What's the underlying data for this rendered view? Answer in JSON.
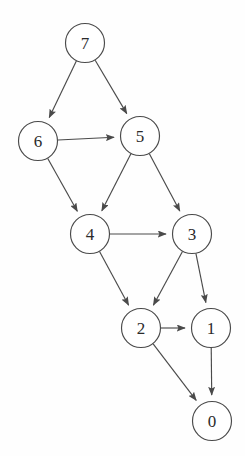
{
  "diagram": {
    "type": "directed-graph",
    "background_color": "#fefefe",
    "stroke_color": "#4a4a4a",
    "label_color": "#2b2b2b",
    "node_fill": "#ffffff",
    "node_radius": 19.5,
    "canvas": {
      "width": 245,
      "height": 456
    },
    "nodes": [
      {
        "id": "7",
        "label": "7",
        "cx": 85,
        "cy": 43,
        "r": 19.5
      },
      {
        "id": "6",
        "label": "6",
        "cx": 38,
        "cy": 141,
        "r": 19.5
      },
      {
        "id": "5",
        "label": "5",
        "cx": 140,
        "cy": 136,
        "r": 19.5
      },
      {
        "id": "4",
        "label": "4",
        "cx": 90,
        "cy": 234,
        "r": 19.5
      },
      {
        "id": "3",
        "label": "3",
        "cx": 192,
        "cy": 234,
        "r": 19.5
      },
      {
        "id": "2",
        "label": "2",
        "cx": 141,
        "cy": 328,
        "r": 19.5
      },
      {
        "id": "1",
        "label": "1",
        "cx": 211,
        "cy": 328,
        "r": 19.5
      },
      {
        "id": "0",
        "label": "0",
        "cx": 212,
        "cy": 421,
        "r": 19.5
      }
    ],
    "edges": [
      {
        "from": "7",
        "to": "6"
      },
      {
        "from": "7",
        "to": "5"
      },
      {
        "from": "6",
        "to": "5"
      },
      {
        "from": "6",
        "to": "4"
      },
      {
        "from": "5",
        "to": "4"
      },
      {
        "from": "5",
        "to": "3"
      },
      {
        "from": "4",
        "to": "3"
      },
      {
        "from": "4",
        "to": "2"
      },
      {
        "from": "3",
        "to": "2"
      },
      {
        "from": "3",
        "to": "1"
      },
      {
        "from": "2",
        "to": "1"
      },
      {
        "from": "2",
        "to": "0"
      },
      {
        "from": "1",
        "to": "0"
      }
    ]
  }
}
